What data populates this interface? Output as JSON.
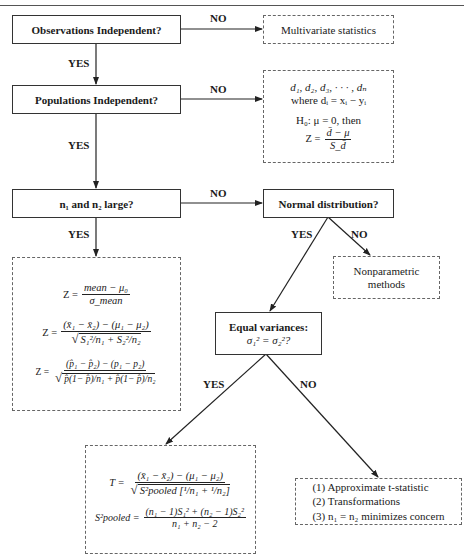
{
  "diagram": {
    "nodes": {
      "obs_indep": {
        "label": "Observations Independent?"
      },
      "multivariate": {
        "label": "Multivariate statistics"
      },
      "pop_indep": {
        "label": "Populations Independent?"
      },
      "paired": {
        "line1": "d₁, d₂, d₃, · · · , dₙ",
        "line2": "where dᵢ = xᵢ − yᵢ",
        "line3": "H₀: μ = 0, then",
        "z_lhs": "Z =",
        "z_num": "d̄ − μ",
        "z_den": "S_d̄"
      },
      "large_n": {
        "label": "n₁ and n₂ large?"
      },
      "normal": {
        "label": "Normal distribution?"
      },
      "z_formulas": {
        "f1_lhs": "Z =",
        "f1_num": "mean − μ₀",
        "f1_den": "σ_mean",
        "f2_lhs": "Z =",
        "f2_num": "(x̄₁ − x̄₂) − (μ₁ − μ₂)",
        "f2_den": "S₁²/n₁ + S₂²/n₂",
        "f3_lhs": "Z =",
        "f3_num": "(p̂₁ − p̂₂) − (p₁ − p₂)",
        "f3_den": "p̂(1− p̂)/n₁ + p̂(1− p̂)/n₂"
      },
      "nonparametric": {
        "line1": "Nonparametric",
        "line2": "methods"
      },
      "equal_var": {
        "line1": "Equal variances:",
        "line2": "σ₁² = σ₂²?"
      },
      "t_formulas": {
        "t_lhs": "T =",
        "t_num": "(x̄₁ − x̄₂) − (μ₁ − μ₂)",
        "t_den": "S²pooled [¹/n₁ + ¹/n₂]",
        "s_lhs": "S²pooled =",
        "s_num": "(n₁ − 1)S₁² + (n₂ − 1)S₂²",
        "s_den": "n₁ + n₂ − 2"
      },
      "unequal": {
        "items": [
          "(1) Approximate t-statistic",
          "(2) Transformations",
          "(3) n₁ = n₂ minimizes concern"
        ]
      }
    },
    "edge_labels": {
      "obs_no": "NO",
      "obs_yes": "YES",
      "pop_no": "NO",
      "pop_yes": "YES",
      "large_no": "NO",
      "large_yes": "YES",
      "normal_yes": "YES",
      "normal_no": "NO",
      "var_yes": "YES",
      "var_no": "NO"
    }
  }
}
